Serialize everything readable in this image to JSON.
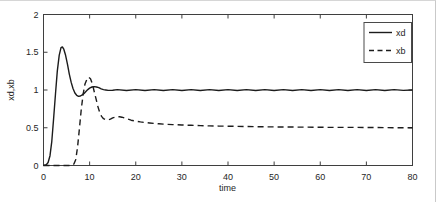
{
  "figure": {
    "background": "#ffffff",
    "frame_color": "#c9c9c9"
  },
  "chart_data": {
    "type": "line",
    "title": "",
    "xlabel": "time",
    "ylabel": "xd,xb",
    "xlim": [
      0,
      80
    ],
    "ylim": [
      0,
      2
    ],
    "xticks": [
      0,
      10,
      20,
      30,
      40,
      50,
      60,
      70,
      80
    ],
    "yticks": [
      0,
      0.5,
      1,
      1.5,
      2
    ],
    "grid": false,
    "box": true,
    "legend_position": "top-right",
    "axis_color": "#3f3f3f",
    "text_color": "#262626",
    "line_color": "#1c1c1c",
    "legend": [
      {
        "label": "xd",
        "line": "solid"
      },
      {
        "label": "xb",
        "line": "dashed"
      }
    ],
    "series": [
      {
        "name": "xd",
        "line": "solid",
        "points": [
          [
            0,
            0
          ],
          [
            0.6,
            0.01
          ],
          [
            1,
            0.04
          ],
          [
            1.4,
            0.13
          ],
          [
            1.8,
            0.32
          ],
          [
            2.2,
            0.62
          ],
          [
            2.6,
            0.95
          ],
          [
            3,
            1.25
          ],
          [
            3.4,
            1.46
          ],
          [
            3.8,
            1.56
          ],
          [
            4.1,
            1.57
          ],
          [
            4.4,
            1.54
          ],
          [
            4.8,
            1.46
          ],
          [
            5.2,
            1.34
          ],
          [
            5.6,
            1.21
          ],
          [
            6,
            1.1
          ],
          [
            6.4,
            1.02
          ],
          [
            6.8,
            0.96
          ],
          [
            7.2,
            0.93
          ],
          [
            7.6,
            0.915
          ],
          [
            8,
            0.92
          ],
          [
            8.4,
            0.935
          ],
          [
            8.8,
            0.955
          ],
          [
            9.2,
            0.98
          ],
          [
            9.6,
            1.005
          ],
          [
            10,
            1.025
          ],
          [
            10.5,
            1.04
          ],
          [
            11,
            1.045
          ],
          [
            11.5,
            1.04
          ],
          [
            12,
            1.03
          ],
          [
            12.5,
            1.015
          ],
          [
            13,
            1.005
          ],
          [
            13.5,
            1.0
          ],
          [
            14,
            0.995
          ],
          [
            15,
            0.996
          ],
          [
            16,
            1.005
          ],
          [
            18,
            0.994
          ],
          [
            20,
            1.005
          ],
          [
            22,
            0.994
          ],
          [
            24,
            1.005
          ],
          [
            26,
            0.994
          ],
          [
            28,
            1.005
          ],
          [
            30,
            0.994
          ],
          [
            32,
            1.005
          ],
          [
            34,
            0.994
          ],
          [
            36,
            1.005
          ],
          [
            38,
            0.994
          ],
          [
            40,
            1.005
          ],
          [
            42,
            0.994
          ],
          [
            44,
            1.005
          ],
          [
            46,
            0.994
          ],
          [
            48,
            1.005
          ],
          [
            50,
            0.994
          ],
          [
            52,
            1.005
          ],
          [
            54,
            0.994
          ],
          [
            56,
            1.005
          ],
          [
            58,
            0.994
          ],
          [
            60,
            1.005
          ],
          [
            62,
            0.994
          ],
          [
            64,
            1.005
          ],
          [
            66,
            0.994
          ],
          [
            68,
            1.005
          ],
          [
            70,
            0.994
          ],
          [
            72,
            1.005
          ],
          [
            74,
            0.994
          ],
          [
            76,
            1.005
          ],
          [
            78,
            0.995
          ],
          [
            80,
            1.0
          ]
        ]
      },
      {
        "name": "xb",
        "line": "dashed",
        "points": [
          [
            0,
            0
          ],
          [
            6,
            0
          ],
          [
            6.6,
            0.02
          ],
          [
            7,
            0.08
          ],
          [
            7.4,
            0.25
          ],
          [
            7.8,
            0.5
          ],
          [
            8.2,
            0.75
          ],
          [
            8.6,
            0.95
          ],
          [
            9,
            1.08
          ],
          [
            9.4,
            1.14
          ],
          [
            9.8,
            1.17
          ],
          [
            10.2,
            1.15
          ],
          [
            10.6,
            1.08
          ],
          [
            11,
            0.98
          ],
          [
            11.4,
            0.88
          ],
          [
            11.8,
            0.78
          ],
          [
            12.2,
            0.7
          ],
          [
            12.6,
            0.65
          ],
          [
            13,
            0.62
          ],
          [
            13.5,
            0.605
          ],
          [
            14,
            0.605
          ],
          [
            14.5,
            0.615
          ],
          [
            15,
            0.63
          ],
          [
            15.5,
            0.64
          ],
          [
            16,
            0.645
          ],
          [
            16.5,
            0.645
          ],
          [
            17,
            0.64
          ],
          [
            17.5,
            0.63
          ],
          [
            18,
            0.62
          ],
          [
            19,
            0.6
          ],
          [
            20,
            0.588
          ],
          [
            21,
            0.578
          ],
          [
            22,
            0.57
          ],
          [
            23,
            0.563
          ],
          [
            24,
            0.557
          ],
          [
            25,
            0.552
          ],
          [
            26,
            0.548
          ],
          [
            28,
            0.542
          ],
          [
            30,
            0.536
          ],
          [
            32,
            0.532
          ],
          [
            34,
            0.528
          ],
          [
            36,
            0.525
          ],
          [
            38,
            0.522
          ],
          [
            40,
            0.52
          ],
          [
            44,
            0.516
          ],
          [
            48,
            0.513
          ],
          [
            52,
            0.51
          ],
          [
            56,
            0.508
          ],
          [
            60,
            0.506
          ],
          [
            64,
            0.505
          ],
          [
            68,
            0.504
          ],
          [
            72,
            0.503
          ],
          [
            76,
            0.501
          ],
          [
            80,
            0.5
          ]
        ]
      }
    ]
  }
}
